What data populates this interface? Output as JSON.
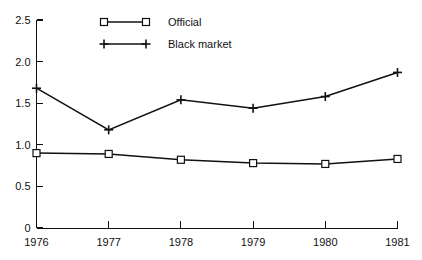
{
  "chart_data": {
    "type": "line",
    "title": "",
    "subtitle": "",
    "xlabel": "",
    "ylabel": "",
    "x": [
      "1976",
      "1977",
      "1978",
      "1979",
      "1980",
      "1981"
    ],
    "categories": [
      "1976",
      "1977",
      "1978",
      "1979",
      "1980",
      "1981"
    ],
    "series": [
      {
        "name": "Official",
        "marker": "open-square",
        "values": [
          0.9,
          0.89,
          0.82,
          0.78,
          0.77,
          0.83
        ]
      },
      {
        "name": "Black market",
        "marker": "plus",
        "values": [
          1.68,
          1.18,
          1.54,
          1.44,
          1.58,
          1.87
        ]
      }
    ],
    "ylim": [
      0,
      2.5
    ],
    "y_ticks": [
      "0",
      "0.5",
      "1.0",
      "1.5",
      "2.0",
      "2.5"
    ],
    "y_tick_values": [
      0,
      0.5,
      1.0,
      1.5,
      2.0,
      2.5
    ],
    "x_ticks": [
      "1976",
      "1977",
      "1978",
      "1979",
      "1980",
      "1981"
    ],
    "grid": false,
    "legend_position": "top-center-left",
    "colors": {
      "line": "#111111",
      "background": "#ffffff",
      "marker_fill": "#ffffff"
    }
  },
  "legend": {
    "entries": [
      {
        "label": "Official",
        "marker": "open-square"
      },
      {
        "label": "Black market",
        "marker": "plus"
      }
    ]
  },
  "axes": {
    "y_tick_labels": [
      "2.5",
      "2.0",
      "1.5",
      "1.0",
      "0.5",
      "0"
    ],
    "x_tick_labels": [
      "1976",
      "1977",
      "1978",
      "1979",
      "1980",
      "1981"
    ]
  }
}
